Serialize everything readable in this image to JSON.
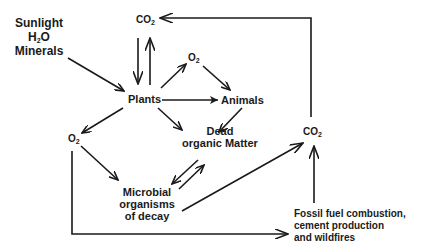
{
  "diagram": {
    "nodes": {
      "inputs": {
        "line1": "Sunlight",
        "line2_main": "H",
        "line2_sub": "2",
        "line2_tail": "O",
        "line3": "Minerals"
      },
      "co2_top": {
        "main": "CO",
        "sub": "2"
      },
      "o2_upper": {
        "main": "O",
        "sub": "2"
      },
      "plants": {
        "label": "Plants"
      },
      "animals": {
        "label": "Animals"
      },
      "dead_matter": {
        "line1": "Dead",
        "line2": "organic Matter"
      },
      "o2_left": {
        "main": "O",
        "sub": "2"
      },
      "microbial": {
        "line1": "Microbial",
        "line2": "organisms",
        "line3": "of decay"
      },
      "co2_right": {
        "main": "CO",
        "sub": "2"
      },
      "fossil": {
        "line1": "Fossil fuel combustion,",
        "line2": "cement production",
        "line3": "and wildfires"
      }
    },
    "edges": [
      {
        "from": "inputs",
        "to": "plants"
      },
      {
        "from": "co2_top",
        "to": "plants"
      },
      {
        "from": "plants",
        "to": "co2_top"
      },
      {
        "from": "plants",
        "to": "o2_upper"
      },
      {
        "from": "o2_upper",
        "to": "animals"
      },
      {
        "from": "plants",
        "to": "animals"
      },
      {
        "from": "plants",
        "to": "dead_matter"
      },
      {
        "from": "animals",
        "to": "dead_matter"
      },
      {
        "from": "plants",
        "to": "o2_left"
      },
      {
        "from": "o2_left",
        "to": "microbial"
      },
      {
        "from": "dead_matter",
        "to": "microbial"
      },
      {
        "from": "microbial",
        "to": "dead_matter"
      },
      {
        "from": "microbial",
        "to": "co2_right"
      },
      {
        "from": "o2_left",
        "to": "fossil"
      },
      {
        "from": "fossil",
        "to": "co2_right"
      },
      {
        "from": "co2_right",
        "to": "co2_top"
      }
    ],
    "colors": {
      "line": "#1a1a1a",
      "background": "#ffffff"
    }
  }
}
